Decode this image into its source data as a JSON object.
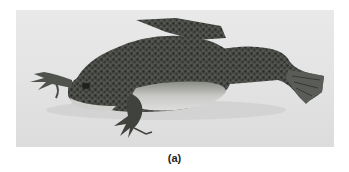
{
  "figure": {
    "caption": "(a)",
    "photo": {
      "subject": "frog",
      "description": "Grayscale photograph of a mottled clawed frog lying on a light surface, facing left, with hind leg and webbed foot extended to the right",
      "colors": {
        "background": "#e6e6e6",
        "skin_dark": "#3a3d38",
        "skin_mid": "#6b6e68",
        "belly": "#cfcfcc",
        "shadow": "#c8c8c8"
      }
    }
  }
}
